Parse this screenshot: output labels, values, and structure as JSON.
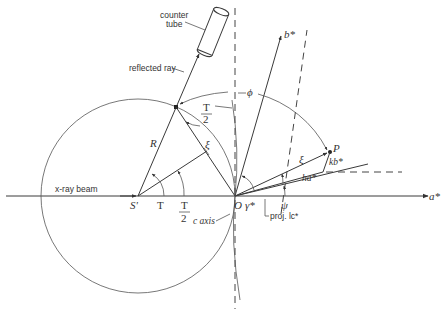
{
  "figure": {
    "labels": {
      "counter_tube_line1": "counter",
      "counter_tube_line2": "tube",
      "reflected_ray": "reflected ray",
      "xray_beam": "x-ray beam",
      "S_prime": "S'",
      "O": "O",
      "R": "R",
      "xi_upper": "ξ",
      "xi_lower": "ξ",
      "phi": "ϕ",
      "T_half_top_num": "T",
      "T_half_top_den": "2",
      "T_angle": "T",
      "T_half_bottom_num": "T",
      "T_half_bottom_den": "2",
      "c_axis": "c axis",
      "gamma_star": "γ*",
      "psi": "ψ",
      "proj_lc": "proj. lc*",
      "b_star": "b*",
      "a_star": "a*",
      "P": "P",
      "kb_star": "kb*",
      "ha_star": "ha*"
    }
  }
}
